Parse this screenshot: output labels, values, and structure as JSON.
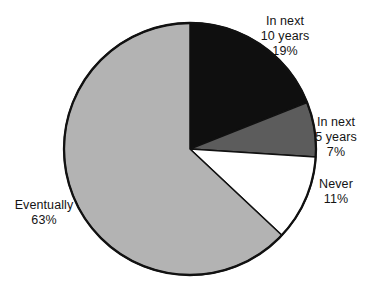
{
  "chart_data": {
    "type": "pie",
    "title": "",
    "start_angle_deg": -90,
    "direction": "clockwise",
    "outline_color": "#111111",
    "background": "#ffffff",
    "slices": [
      {
        "label": "In next 10 years",
        "value": 19,
        "pct_label": "19%",
        "color": "#0f0f0f",
        "label_lines": [
          "In next",
          "10 years",
          "19%"
        ]
      },
      {
        "label": "In next 5 years",
        "value": 7,
        "pct_label": "7%",
        "color": "#5c5c5c",
        "label_lines": [
          "In next",
          "5 years",
          "7%"
        ]
      },
      {
        "label": "Never",
        "value": 11,
        "pct_label": "11%",
        "color": "#ffffff",
        "label_lines": [
          "Never",
          "11%"
        ]
      },
      {
        "label": "Eventually",
        "value": 63,
        "pct_label": "63%",
        "color": "#b3b3b3",
        "label_lines": [
          "Eventually",
          "63%"
        ]
      }
    ]
  }
}
